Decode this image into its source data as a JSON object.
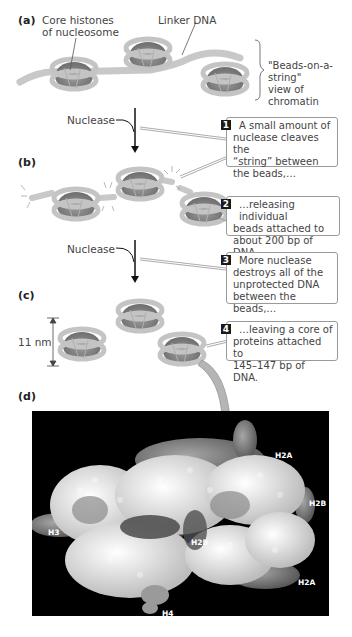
{
  "panels": {
    "a": {
      "label": "(a)",
      "core_histones_label_line1": "Core histones",
      "core_histones_label_line2": "of nucleosome",
      "linker_dna_label": "Linker DNA",
      "view_label_line1": "\"Beads-on-a-string\"",
      "view_label_line2": "view of chromatin"
    },
    "b": {
      "label": "(b)"
    },
    "c": {
      "label": "(c)",
      "dimension_label": "11 nm"
    },
    "d": {
      "label": "(d)",
      "histone_labels": [
        "H2A",
        "H2B",
        "H3",
        "H2B",
        "H2A",
        "H4"
      ]
    }
  },
  "arrows": {
    "nuclease_1": "Nuclease",
    "nuclease_2": "Nuclease"
  },
  "steps": [
    {
      "number": "1",
      "line1": "A small amount of",
      "line2": "nuclease cleaves the",
      "line3": "“string” between",
      "line4": "the beads,…"
    },
    {
      "number": "2",
      "line1": "…releasing individual",
      "line2": "beads attached to",
      "line3": "about 200 bp of DNA."
    },
    {
      "number": "3",
      "line1": "More nuclease",
      "line2": "destroys all of the",
      "line3": "unprotected DNA",
      "line4": "between the beads,…"
    },
    {
      "number": "4",
      "line1": "…leaving a core of",
      "line2": "proteins attached to",
      "line3": "145–147 bp of DNA."
    }
  ],
  "colors": {
    "bead_light": "#c4c4c4",
    "bead_dark": "#8a8a8a",
    "structure_bg": "#000000",
    "badge": "#1a1a1a"
  }
}
